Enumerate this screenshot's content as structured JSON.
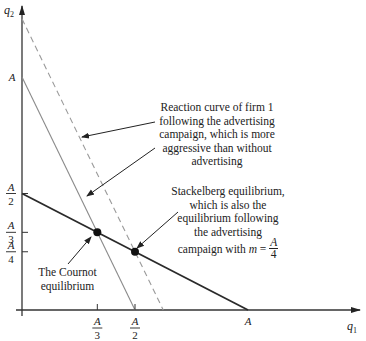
{
  "axes": {
    "x_label": "q",
    "x_label_sub": "1",
    "y_label": "q",
    "y_label_sub": "2"
  },
  "ticks": {
    "x": [
      {
        "num": "A",
        "den": "3",
        "value": 0.3333
      },
      {
        "num": "A",
        "den": "2",
        "value": 0.5
      },
      {
        "num": "A",
        "den": "",
        "value": 1
      }
    ],
    "y": [
      {
        "num": "A",
        "den": "",
        "value": 1
      },
      {
        "num": "A",
        "den": "2",
        "value": 0.5
      },
      {
        "num": "A",
        "den": "3",
        "value": 0.3333
      },
      {
        "num": "A",
        "den": "4",
        "value": 0.25
      }
    ]
  },
  "curves": {
    "firm2_reaction": {
      "q1_intercept": 1,
      "q2_intercept": 0.5,
      "style": "solid-dark"
    },
    "firm1_reaction": {
      "q1_intercept": 0.5,
      "q2_intercept": 1,
      "style": "solid-gray"
    },
    "firm1_reaction_advertising": {
      "q1_intercept": 0.625,
      "q2_intercept": 1.25,
      "style": "dashed-gray"
    }
  },
  "points": {
    "cournot": {
      "q1": 0.3333,
      "q2": 0.3333
    },
    "stackelberg": {
      "q1": 0.5,
      "q2": 0.25
    }
  },
  "annotations": {
    "reaction_curve_note": [
      "Reaction curve of firm 1",
      "following the advertising",
      "campaign, which is more",
      "aggressive than without",
      "advertising"
    ],
    "stackelberg_note": [
      "Stackelberg equilibrium,",
      "which is also the",
      "equilibrium following",
      "the advertising"
    ],
    "stackelberg_note_last": "campaign with ",
    "stackelberg_note_m": "m",
    "stackelberg_note_eq": " = ",
    "stackelberg_note_frac_num": "A",
    "stackelberg_note_frac_den": "4",
    "cournot_note": [
      "The Cournot",
      "equilibrium"
    ]
  },
  "colors": {
    "dark_line": "#2a2a2a",
    "gray_line": "#8a8a8a",
    "dashed_line": "#9a9a9a",
    "axis": "#333333"
  }
}
